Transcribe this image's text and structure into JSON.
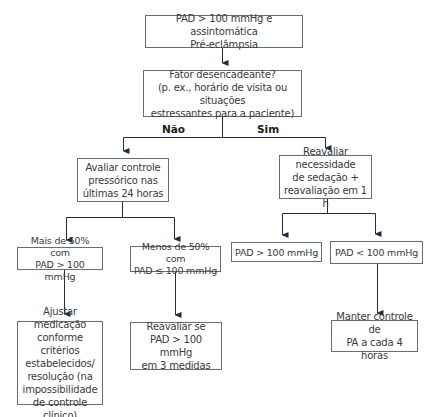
{
  "diagram": {
    "type": "flowchart",
    "colors": {
      "line": "#1e2d48",
      "box_border": "#5f6d80",
      "text": "#3a3a3a"
    },
    "nodes": {
      "start": "PAD > 100 mmHg e assintomática\nPré-eclâmpsia",
      "trigger": "Fator desencadeante?\n(p. ex., horário de visita ou situações\nestressantes para a paciente)",
      "evaluate_control": "Avaliar controle\npressórico nas\núltimas 24 horas",
      "reassess_sedation": "Reavaliar necessidade\nde sedação +\nreavaliação em 1 h",
      "more_50": "Mais de 50% com\nPAD > 100 mmHg",
      "less_50": "Menos de 50% com\nPAD ≤ 100 mmHg",
      "pad_above": "PAD > 100 mmHg",
      "pad_below": "PAD < 100 mmHg",
      "adjust_medication": "Ajustar medicação\nconforme critérios\nestabelecidos/\nresolução (na\nimpossibilidade\nde controle clínico)",
      "reassess_if": "Reavaliar se\nPAD > 100 mmHg\nem 3 medidas",
      "maintain_control": "Manter controle de\nPA a cada 4 horas"
    },
    "branch_labels": {
      "no": "Não",
      "yes": "Sim"
    },
    "edges": [
      [
        "start",
        "trigger"
      ],
      [
        "trigger",
        "evaluate_control",
        "Não"
      ],
      [
        "trigger",
        "reassess_sedation",
        "Sim"
      ],
      [
        "evaluate_control",
        "more_50"
      ],
      [
        "evaluate_control",
        "less_50"
      ],
      [
        "reassess_sedation",
        "pad_above"
      ],
      [
        "reassess_sedation",
        "pad_below"
      ],
      [
        "more_50",
        "adjust_medication"
      ],
      [
        "less_50",
        "reassess_if"
      ],
      [
        "pad_below",
        "maintain_control"
      ]
    ]
  }
}
